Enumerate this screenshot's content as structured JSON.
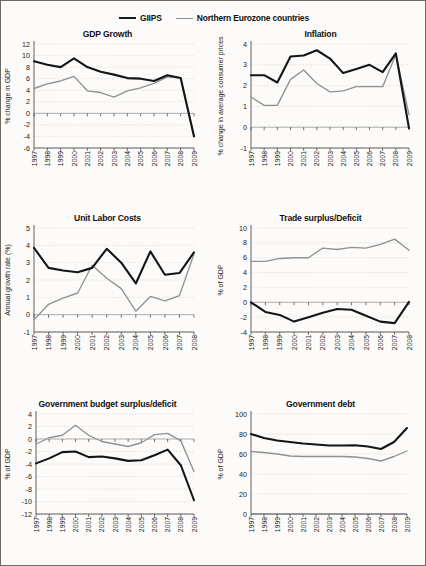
{
  "legend": {
    "entries": [
      {
        "label": "GIIPS",
        "color": "#151515",
        "style": "thick"
      },
      {
        "label": "Northern Eurozone countries",
        "color": "#919191",
        "style": "thin"
      }
    ]
  },
  "chart_data": [
    {
      "id": "gdp-growth",
      "type": "line",
      "title": "GDP Growth",
      "xlabel": "",
      "ylabel": "% change in GDP",
      "ylim": [
        -6,
        12
      ],
      "yticks": [
        -6,
        -4,
        -2,
        0,
        2,
        4,
        6,
        8,
        10,
        12
      ],
      "grid": true,
      "legend_position": "figure-top",
      "categories": [
        "1997",
        "1998",
        "1999",
        "2000",
        "2001",
        "2002",
        "2003",
        "2004",
        "2005",
        "2006",
        "2007",
        "2008",
        "2009"
      ],
      "series": [
        {
          "name": "GIIPS",
          "values": [
            9.0,
            8.4,
            8.0,
            9.5,
            8.0,
            7.2,
            6.7,
            6.1,
            6.0,
            5.6,
            6.6,
            6.1,
            -4.0
          ]
        },
        {
          "name": "Northern Eurozone countries",
          "values": [
            4.3,
            5.1,
            5.6,
            6.4,
            3.9,
            3.6,
            2.8,
            3.9,
            4.4,
            5.2,
            6.3,
            6.1,
            -3.8
          ]
        }
      ]
    },
    {
      "id": "inflation",
      "type": "line",
      "title": "Inflation",
      "xlabel": "",
      "ylabel": "% change in average consumer prices",
      "ylim": [
        -1,
        4
      ],
      "yticks": [
        -1,
        0,
        1,
        2,
        3,
        4
      ],
      "grid": true,
      "legend_position": "figure-top",
      "categories": [
        "1997",
        "1998",
        "1999",
        "2000",
        "2001",
        "2002",
        "2003",
        "2004",
        "2005",
        "2006",
        "2007",
        "2008",
        "2009"
      ],
      "series": [
        {
          "name": "GIIPS",
          "values": [
            2.5,
            2.5,
            2.15,
            3.4,
            3.45,
            3.7,
            3.3,
            2.6,
            2.8,
            3.0,
            2.65,
            3.55,
            -0.05
          ]
        },
        {
          "name": "Northern Eurozone countries",
          "values": [
            1.45,
            1.05,
            1.05,
            2.3,
            2.75,
            2.1,
            1.7,
            1.75,
            1.95,
            1.95,
            1.95,
            3.5,
            0.6
          ]
        }
      ]
    },
    {
      "id": "unit-labor-costs",
      "type": "line",
      "title": "Unit Labor Costs",
      "xlabel": "",
      "ylabel": "Annual growth rate (%)",
      "ylim": [
        -1,
        5
      ],
      "yticks": [
        -1,
        0,
        1,
        2,
        3,
        4,
        5
      ],
      "grid": true,
      "legend_position": "figure-top",
      "categories": [
        "1997",
        "1998",
        "1999",
        "2000",
        "2001",
        "2002",
        "2003",
        "2004",
        "2005",
        "2006",
        "2007",
        "2008"
      ],
      "series": [
        {
          "name": "GIIPS",
          "values": [
            3.85,
            2.7,
            2.55,
            2.45,
            2.7,
            3.8,
            3.0,
            1.8,
            3.65,
            2.3,
            2.4,
            3.6
          ]
        },
        {
          "name": "Northern Eurozone countries",
          "values": [
            -0.3,
            0.6,
            0.95,
            1.25,
            2.85,
            2.1,
            1.5,
            0.2,
            1.05,
            0.8,
            1.1,
            3.5
          ]
        }
      ]
    },
    {
      "id": "trade-surplus-deficit",
      "type": "line",
      "title": "Trade surplus/Deficit",
      "xlabel": "",
      "ylabel": "% of GDP",
      "ylim": [
        -4,
        10
      ],
      "yticks": [
        -4,
        -2,
        0,
        2,
        4,
        6,
        8,
        10
      ],
      "grid": true,
      "legend_position": "figure-top",
      "categories": [
        "1997",
        "1998",
        "1999",
        "2000",
        "2001",
        "2002",
        "2003",
        "2004",
        "2005",
        "2006",
        "2007",
        "2008"
      ],
      "series": [
        {
          "name": "GIIPS",
          "values": [
            0.0,
            -1.3,
            -1.7,
            -2.6,
            -2.0,
            -1.4,
            -0.9,
            -1.0,
            -1.8,
            -2.6,
            -2.8,
            0.05
          ]
        },
        {
          "name": "Northern Eurozone countries",
          "values": [
            5.5,
            5.5,
            5.9,
            6.0,
            6.0,
            7.3,
            7.1,
            7.4,
            7.3,
            7.8,
            8.5,
            7.0
          ]
        }
      ]
    },
    {
      "id": "government-budget-surplus-deficit",
      "type": "line",
      "title": "Government budget surplus/deficit",
      "xlabel": "",
      "ylabel": "% of GDP",
      "ylim": [
        -12,
        4
      ],
      "yticks": [
        -12,
        -10,
        -8,
        -6,
        -4,
        -2,
        0,
        2,
        4
      ],
      "grid": true,
      "legend_position": "figure-top",
      "categories": [
        "1997",
        "1998",
        "1999",
        "2000",
        "2001",
        "2002",
        "2003",
        "2004",
        "2005",
        "2006",
        "2007",
        "2008",
        "2009"
      ],
      "series": [
        {
          "name": "GIIPS",
          "values": [
            -3.9,
            -3.1,
            -2.1,
            -2.0,
            -2.9,
            -2.8,
            -3.1,
            -3.5,
            -3.4,
            -2.6,
            -1.7,
            -4.2,
            -9.8
          ]
        },
        {
          "name": "Northern Eurozone countries",
          "values": [
            -0.8,
            0.2,
            0.6,
            2.2,
            0.6,
            -0.4,
            -0.8,
            -1.2,
            -0.6,
            0.7,
            0.9,
            -0.3,
            -5.2
          ]
        }
      ]
    },
    {
      "id": "government-debt",
      "type": "line",
      "title": "Government debt",
      "xlabel": "",
      "ylabel": "% of GDP",
      "ylim": [
        0,
        100
      ],
      "yticks": [
        0,
        20,
        40,
        60,
        80,
        100
      ],
      "grid": true,
      "legend_position": "figure-top",
      "categories": [
        "1997",
        "1998",
        "1999",
        "2000",
        "2001",
        "2002",
        "2003",
        "2004",
        "2005",
        "2006",
        "2007",
        "2008",
        "2009"
      ],
      "series": [
        {
          "name": "GIIPS",
          "values": [
            80.0,
            76.0,
            73.5,
            72.0,
            70.5,
            69.5,
            68.5,
            68.5,
            68.8,
            67.5,
            65.0,
            72.0,
            86.0
          ]
        },
        {
          "name": "Northern Eurozone countries",
          "values": [
            62.5,
            61.5,
            60.0,
            58.0,
            57.5,
            57.5,
            57.5,
            57.5,
            57.0,
            55.5,
            53.0,
            57.5,
            63.0
          ]
        }
      ]
    }
  ],
  "panel_geometry": [
    {
      "id": "gdp-growth",
      "w": 213,
      "h": 184,
      "plot": {
        "x": 33,
        "y": 17,
        "w": 160,
        "h": 104
      },
      "xlabel_y": 124
    },
    {
      "id": "inflation",
      "w": 213,
      "h": 184,
      "plot": {
        "x": 37,
        "y": 17,
        "w": 158,
        "h": 104
      },
      "xlabel_y": 124
    },
    {
      "id": "unit-labor-costs",
      "w": 213,
      "h": 186,
      "plot": {
        "x": 33,
        "y": 17,
        "w": 160,
        "h": 104
      },
      "xlabel_y": 124
    },
    {
      "id": "trade-surplus-deficit",
      "w": 213,
      "h": 186,
      "plot": {
        "x": 37,
        "y": 17,
        "w": 158,
        "h": 104
      },
      "xlabel_y": 124
    },
    {
      "id": "government-budget-surplus-deficit",
      "w": 213,
      "h": 168,
      "plot": {
        "x": 35,
        "y": 17,
        "w": 158,
        "h": 100
      },
      "xlabel_y": 120
    },
    {
      "id": "government-debt",
      "w": 213,
      "h": 168,
      "plot": {
        "x": 37,
        "y": 17,
        "w": 156,
        "h": 100
      },
      "xlabel_y": 120
    }
  ]
}
